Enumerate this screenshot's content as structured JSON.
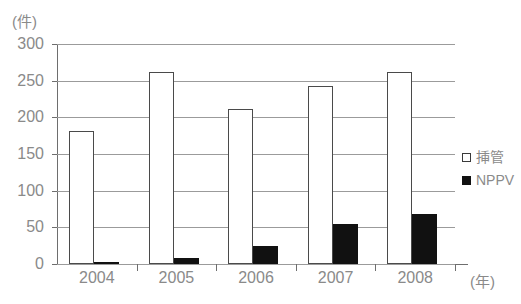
{
  "chart_data": {
    "type": "bar",
    "title": "",
    "subtitle": "",
    "xlabel": "(年)",
    "ylabel": "(件)",
    "categories": [
      "2004",
      "2005",
      "2006",
      "2007",
      "2008"
    ],
    "series": [
      {
        "name": "挿管",
        "marker": "open-square",
        "color": "#ffffff",
        "edge_color": "#4a4a4a",
        "values": [
          182,
          262,
          211,
          243,
          262
        ]
      },
      {
        "name": "NPPV",
        "marker": "filled-square",
        "color": "#111111",
        "edge_color": "#111111",
        "values": [
          3,
          8,
          24,
          55,
          68
        ]
      }
    ],
    "ylim": [
      0,
      300
    ],
    "ytick_step": 50,
    "yticks": [
      "300",
      "250",
      "200",
      "150",
      "100",
      "50",
      "0"
    ],
    "grid": true,
    "grid_axis": "y",
    "legend_position": "right",
    "legend": [
      "挿管",
      "NPPV"
    ]
  },
  "axes": {
    "y_unit": "(件)",
    "x_unit": "(年)"
  },
  "colors": {
    "text": "#8a8a8a",
    "axis": "#6e6e6e",
    "grid": "#9b9b9b",
    "bar_open": "#ffffff",
    "bar_filled": "#111111",
    "background": "#ffffff"
  }
}
